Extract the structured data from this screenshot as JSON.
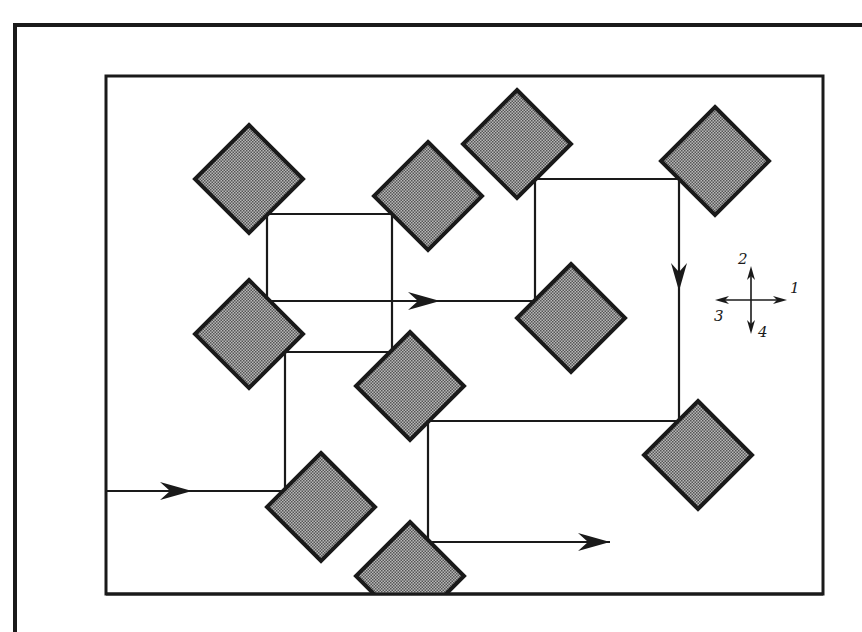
{
  "diagram": {
    "colors": {
      "stroke": "#1a1a1a",
      "node_fill": "#8a8a8a",
      "node_fill_light": "#b8b8b8",
      "background": "#ffffff"
    },
    "outer_frame": {
      "x": 15,
      "y": 25,
      "right": 862,
      "bottom": 632
    },
    "inner_frame": {
      "x": 106,
      "y": 76,
      "width": 717,
      "height": 518
    },
    "nodes": [
      {
        "id": "A",
        "cx": 249,
        "cy": 179,
        "r": 54
      },
      {
        "id": "B",
        "cx": 428,
        "cy": 196,
        "r": 54
      },
      {
        "id": "C",
        "cx": 517,
        "cy": 144,
        "r": 54
      },
      {
        "id": "D",
        "cx": 715,
        "cy": 161,
        "r": 54
      },
      {
        "id": "E",
        "cx": 249,
        "cy": 334,
        "r": 54
      },
      {
        "id": "F",
        "cx": 571,
        "cy": 318,
        "r": 54
      },
      {
        "id": "G",
        "cx": 410,
        "cy": 386,
        "r": 54
      },
      {
        "id": "H",
        "cx": 698,
        "cy": 455,
        "r": 54
      },
      {
        "id": "I",
        "cx": 321,
        "cy": 507,
        "r": 54
      },
      {
        "id": "J",
        "cx": 410,
        "cy": 576,
        "r": 54,
        "clipped": true
      }
    ],
    "links": [
      {
        "from": [
          267,
          214
        ],
        "to": [
          392,
          214
        ]
      },
      {
        "from": [
          267,
          214
        ],
        "to": [
          267,
          301
        ]
      },
      {
        "from": [
          392,
          214
        ],
        "to": [
          392,
          352
        ]
      },
      {
        "from": [
          267,
          301
        ],
        "to": [
          535,
          301
        ]
      },
      {
        "from": [
          535,
          179
        ],
        "to": [
          679,
          179
        ]
      },
      {
        "from": [
          535,
          179
        ],
        "to": [
          535,
          301
        ]
      },
      {
        "from": [
          679,
          179
        ],
        "to": [
          679,
          421
        ]
      },
      {
        "from": [
          285,
          352
        ],
        "to": [
          392,
          352
        ]
      },
      {
        "from": [
          285,
          352
        ],
        "to": [
          285,
          491
        ]
      },
      {
        "from": [
          106,
          491
        ],
        "to": [
          285,
          491
        ]
      },
      {
        "from": [
          428,
          421
        ],
        "to": [
          679,
          421
        ]
      },
      {
        "from": [
          428,
          421
        ],
        "to": [
          428,
          542
        ]
      },
      {
        "from": [
          428,
          542
        ],
        "to": [
          610,
          542
        ]
      }
    ],
    "arrows": [
      {
        "id": "entry-arrow",
        "x": 192,
        "y": 491,
        "direction": "right"
      },
      {
        "id": "middle-arrow",
        "x": 440,
        "y": 301,
        "direction": "right"
      },
      {
        "id": "down-arrow",
        "x": 679,
        "y": 291,
        "direction": "down"
      },
      {
        "id": "exit-arrow",
        "x": 610,
        "y": 542,
        "direction": "right"
      }
    ],
    "legend": {
      "center": {
        "x": 751,
        "y": 300
      },
      "labels": [
        {
          "text": "1",
          "direction": "east",
          "x": 790,
          "y": 293
        },
        {
          "text": "2",
          "direction": "north",
          "x": 738,
          "y": 264
        },
        {
          "text": "3",
          "direction": "west",
          "x": 714,
          "y": 321
        },
        {
          "text": "4",
          "direction": "south",
          "x": 758,
          "y": 337
        }
      ]
    }
  }
}
